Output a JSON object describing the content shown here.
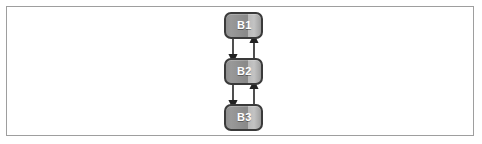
{
  "canvas": {
    "width": 482,
    "height": 144,
    "background_color": "#ffffff",
    "border_color": "#9e9e9e"
  },
  "diagram": {
    "type": "state-transition-diagram",
    "orientation": "vertical",
    "node_fill_color": "#9a9a9a",
    "node_border_color": "#3a3a3a",
    "node_label_color": "#ffffff",
    "edge_color": "#222222",
    "nodes": [
      {
        "id": "B1",
        "label": "B1",
        "x": 224,
        "y": 12,
        "width": 39,
        "height": 27
      },
      {
        "id": "B2",
        "label": "B2",
        "x": 224,
        "y": 58,
        "width": 39,
        "height": 27
      },
      {
        "id": "B3",
        "label": "B3",
        "x": 224,
        "y": 104,
        "width": 39,
        "height": 27
      }
    ],
    "edges": [
      {
        "from": "B1",
        "to": "B2",
        "direction": "down",
        "label": ""
      },
      {
        "from": "B2",
        "to": "B1",
        "direction": "up",
        "label": ""
      },
      {
        "from": "B2",
        "to": "B3",
        "direction": "down",
        "label": ""
      },
      {
        "from": "B3",
        "to": "B2",
        "direction": "up",
        "label": ""
      }
    ]
  }
}
